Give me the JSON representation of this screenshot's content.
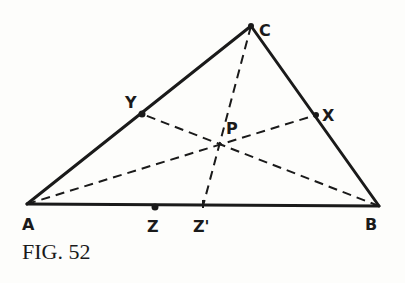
{
  "figure": {
    "caption": "FIG. 52",
    "points": {
      "A": {
        "label": "A",
        "x": 27,
        "y": 204
      },
      "B": {
        "label": "B",
        "x": 379,
        "y": 206
      },
      "C": {
        "label": "C",
        "x": 251,
        "y": 26
      },
      "X": {
        "label": "X",
        "x": 316,
        "y": 115
      },
      "Y": {
        "label": "Y",
        "x": 142,
        "y": 114
      },
      "P": {
        "label": "P",
        "x": 220,
        "y": 147
      },
      "Z": {
        "label": "Z",
        "x": 155,
        "y": 207
      },
      "Z2": {
        "label": "Z'",
        "x": 203,
        "y": 206
      }
    },
    "solid_segments": [
      "AB",
      "BC",
      "CA"
    ],
    "dashed_segments": [
      "AX",
      "BY",
      "CZ'"
    ]
  }
}
